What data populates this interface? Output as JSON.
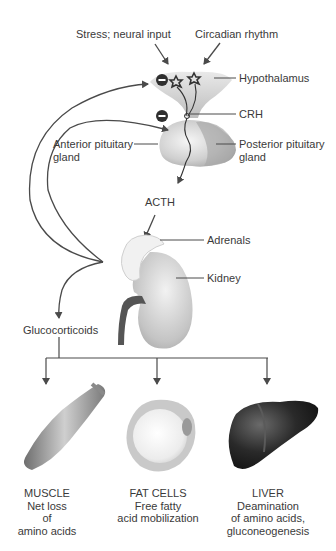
{
  "inputs": {
    "stress": "Stress; neural input",
    "circadian": "Circadian rhythm"
  },
  "labels": {
    "hypothalamus": "Hypothalamus",
    "crh": "CRH",
    "anterior_pituitary_1": "Anterior pituitary",
    "anterior_pituitary_2": "gland",
    "posterior_pituitary_1": "Posterior pituitary",
    "posterior_pituitary_2": "gland",
    "acth": "ACTH",
    "adrenals": "Adrenals",
    "kidney": "Kidney",
    "glucocorticoids": "Glucocorticoids"
  },
  "feedback": {
    "symbol": "−",
    "targets": [
      "Hypothalamus",
      "Anterior pituitary gland"
    ],
    "type": "negative feedback"
  },
  "targets": [
    {
      "name": "MUSCLE",
      "lines": [
        "Net loss",
        "of",
        "amino acids"
      ]
    },
    {
      "name": "FAT CELLS",
      "lines": [
        "Free fatty",
        "acid mobilization"
      ]
    },
    {
      "name": "LIVER",
      "lines": [
        "Deamination",
        "of amino acids,",
        "gluconeogenesis"
      ]
    }
  ],
  "colors": {
    "line": "#4a4a4a",
    "organ_light": "#e6e6e6",
    "organ_mid": "#b5b5b5",
    "liver": "#1e1e1e",
    "minus_badge": "#2f2f2f"
  }
}
